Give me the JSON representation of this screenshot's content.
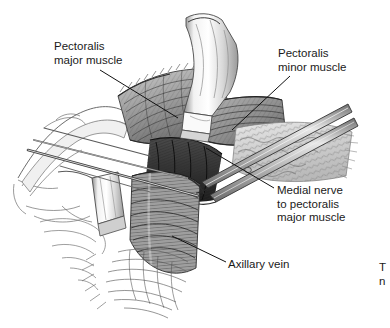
{
  "figure": {
    "number": "3",
    "kind": "surgical anatomy line illustration",
    "background_color": "#ffffff",
    "ink_color": "#1a1a1a"
  },
  "labels": {
    "pectoralis_major": "Pectoralis\nmajor muscle",
    "pectoralis_minor": "Pectoralis\nminor muscle",
    "medial_nerve": "Medial nerve\nto pectoralis\nmajor muscle",
    "axillary_vein": "Axillary vein",
    "clipped_right_edge": "T\nn"
  },
  "structures": [
    {
      "name": "pectoralis-major-muscle",
      "label": "Pectoralis major muscle"
    },
    {
      "name": "pectoralis-minor-muscle",
      "label": "Pectoralis minor muscle"
    },
    {
      "name": "medial-pectoral-nerve",
      "label": "Medial nerve to pectoralis major muscle"
    },
    {
      "name": "axillary-vein",
      "label": "Axillary vein"
    }
  ],
  "instruments": [
    {
      "name": "center-retractor",
      "label": "metal retractor blade, center"
    },
    {
      "name": "left-retractor",
      "label": "metal retractor blade, lower left"
    },
    {
      "name": "forceps",
      "label": "long forceps entering from upper right"
    },
    {
      "name": "probe-shafts",
      "label": "slender instrument shafts from left"
    }
  ]
}
